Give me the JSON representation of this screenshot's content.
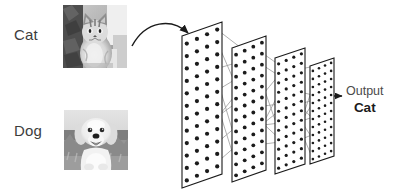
{
  "diagram": {
    "background_color": "#ffffff",
    "ink_color": "#1b1b1b",
    "connection_color": "#9a9a9a",
    "text_color": "#3d3d3d"
  },
  "inputs": [
    {
      "label": "Cat",
      "image": "cat-photo-grayscale",
      "selected": true
    },
    {
      "label": "Dog",
      "image": "dog-photo-grayscale",
      "selected": false
    }
  ],
  "flow": {
    "input_arrow": "curved-arrow-icon",
    "output_arrow": "arrow-right-icon"
  },
  "output": {
    "caption": "Output",
    "prediction": "Cat"
  },
  "network": {
    "layer_count": 4,
    "layers": [
      {
        "name": "layer-1",
        "columns": 4,
        "rows": 12,
        "x": 182,
        "y": 22,
        "width": 40,
        "height": 152,
        "skew": 14,
        "dot_radius": 2.1
      },
      {
        "name": "layer-2",
        "columns": 4,
        "rows": 12,
        "x": 232,
        "y": 36,
        "width": 34,
        "height": 134,
        "skew": 12,
        "dot_radius": 1.9
      },
      {
        "name": "layer-3",
        "columns": 4,
        "rows": 12,
        "x": 275,
        "y": 48,
        "width": 30,
        "height": 116,
        "skew": 10,
        "dot_radius": 1.6
      },
      {
        "name": "layer-4",
        "columns": 4,
        "rows": 12,
        "x": 310,
        "y": 58,
        "width": 24,
        "height": 98,
        "skew": 8,
        "dot_radius": 1.3
      }
    ]
  }
}
